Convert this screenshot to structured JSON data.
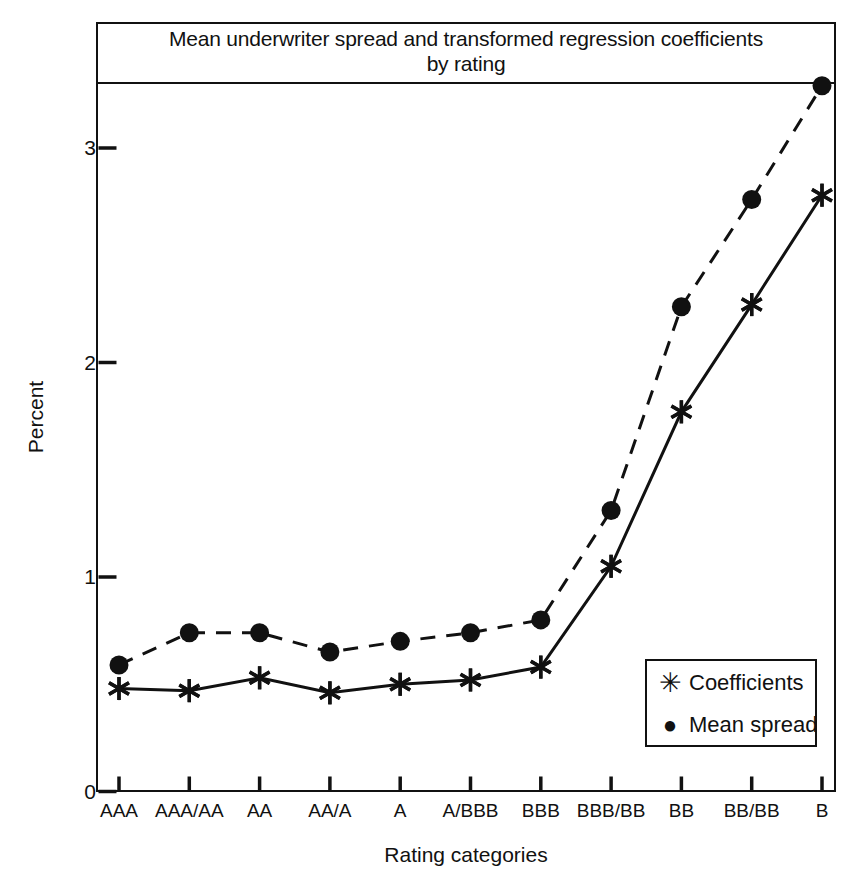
{
  "figure": {
    "title_line1": "Mean underwriter spread and transformed regression coefficients",
    "title_line2": "by rating",
    "ylabel": "Percent",
    "xlabel": "Rating categories"
  },
  "legend": {
    "items": [
      {
        "mark": "star-marker",
        "glyph": "✳",
        "label": "Coefficients"
      },
      {
        "mark": "dot-marker",
        "glyph": "●",
        "label": "Mean spread"
      }
    ]
  },
  "chart_data": {
    "type": "line",
    "title": "Mean underwriter spread and transformed regression coefficients by rating",
    "xlabel": "Rating categories",
    "ylabel": "Percent",
    "ylim": [
      0,
      3.48
    ],
    "yticks": [
      0,
      1,
      2,
      3
    ],
    "ytick_labels": [
      "0",
      "1",
      "2",
      "3"
    ],
    "grid": false,
    "legend_position": "inside-bottom-right",
    "categories": [
      "AAA",
      "AAA/AA",
      "AA",
      "AA/A",
      "A",
      "A/BBB",
      "BBB",
      "BBB/BB",
      "BB",
      "BB/BB",
      "B"
    ],
    "series": [
      {
        "name": "Mean spread",
        "marker": "filled-circle",
        "linestyle": "dashed",
        "values": [
          0.59,
          0.74,
          0.74,
          0.65,
          0.7,
          0.74,
          0.8,
          1.31,
          2.26,
          2.76,
          3.29
        ]
      },
      {
        "name": "Coefficients",
        "marker": "asterisk",
        "linestyle": "solid",
        "values": [
          0.48,
          0.47,
          0.53,
          0.46,
          0.5,
          0.52,
          0.58,
          1.05,
          1.77,
          2.27,
          2.78
        ]
      }
    ]
  }
}
